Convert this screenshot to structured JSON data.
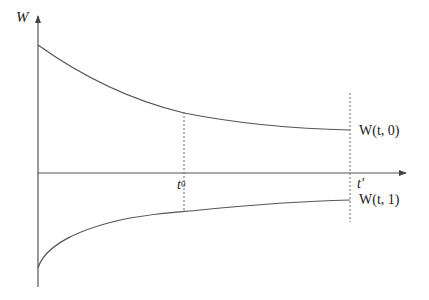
{
  "diagram": {
    "type": "line-diagram",
    "axes": {
      "y_label": "W",
      "x_axis_unlabeled": true
    },
    "markers": {
      "t0": {
        "base": "t",
        "sup": "0"
      },
      "t_prime": "t′"
    },
    "curves": [
      {
        "name": "upper",
        "label": "W(t, 0)",
        "shape": "decreasing convex, approaches horizontal"
      },
      {
        "name": "lower",
        "label": "W(t, 1)",
        "shape": "increasing concave, approaches horizontal"
      }
    ],
    "colors": {
      "line": "#555555",
      "text": "#222222",
      "background": "#ffffff"
    }
  }
}
